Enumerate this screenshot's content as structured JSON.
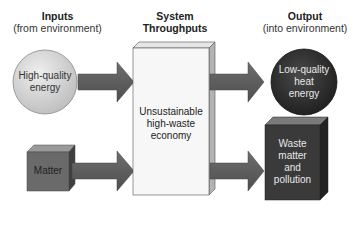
{
  "headers": {
    "inputs": {
      "title": "Inputs",
      "subtitle": "(from environment)"
    },
    "throughputs": {
      "title_line1": "System",
      "title_line2": "Throughputs"
    },
    "output": {
      "title": "Output",
      "subtitle": "(into environment)"
    }
  },
  "nodes": {
    "high_quality_energy": {
      "line1": "High-quality",
      "line2": "energy"
    },
    "matter": {
      "label": "Matter"
    },
    "economy": {
      "line1": "Unsustainable",
      "line2": "high-waste",
      "line3": "economy"
    },
    "low_quality_heat": {
      "line1": "Low-quality",
      "line2": "heat",
      "line3": "energy"
    },
    "waste": {
      "line1": "Waste",
      "line2": "matter",
      "line3": "and",
      "line4": "pollution"
    }
  },
  "colors": {
    "arrow": "#5e5e5e",
    "light_circle": "#d6d6d6",
    "dark_circle": "#2e2e2e",
    "matter_box": "#6a6a6a",
    "waste_box": "#3a3a3a",
    "economy_box": "#f7f7f7"
  }
}
